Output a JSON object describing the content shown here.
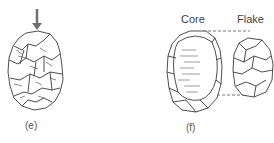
{
  "figure": {
    "panels": [
      {
        "id": "e",
        "caption": "(e)",
        "elements": [
          "downward-arrow",
          "prepared-core-stone"
        ]
      },
      {
        "id": "f",
        "caption": "(f)",
        "labels": {
          "core": "Core",
          "flake": "Flake"
        },
        "elements": [
          "core-after-removal",
          "detached-flake",
          "dashed-connector-lines"
        ]
      }
    ],
    "colors": {
      "line": "#3a3a3a",
      "arrow": "#707070",
      "dash": "#555555",
      "background": "#ffffff"
    }
  }
}
